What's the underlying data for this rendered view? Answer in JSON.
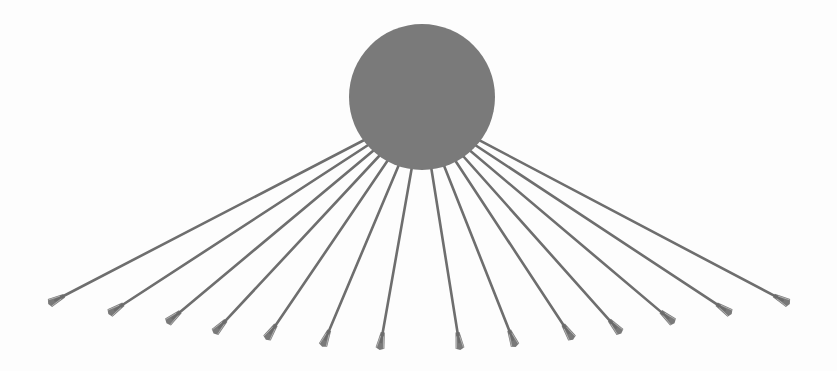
{
  "diagram": {
    "colors": {
      "background": "#fdfdfd",
      "circle_fill": "#7a7a7a",
      "ray_stroke": "#6e6e6e",
      "tip_fill": "#6a6a6a"
    },
    "circle": {
      "cx": 422,
      "cy": 97,
      "r": 73
    },
    "ray_origin": {
      "x": 422,
      "y": 110
    },
    "ray_width": 2.6,
    "rays": [
      {
        "x": 50,
        "y": 303
      },
      {
        "x": 110,
        "y": 313
      },
      {
        "x": 168,
        "y": 322
      },
      {
        "x": 215,
        "y": 332
      },
      {
        "x": 267,
        "y": 338
      },
      {
        "x": 323,
        "y": 345
      },
      {
        "x": 380,
        "y": 348
      },
      {
        "x": 460,
        "y": 348
      },
      {
        "x": 515,
        "y": 345
      },
      {
        "x": 572,
        "y": 338
      },
      {
        "x": 620,
        "y": 332
      },
      {
        "x": 673,
        "y": 322
      },
      {
        "x": 730,
        "y": 313
      },
      {
        "x": 788,
        "y": 303
      }
    ]
  }
}
